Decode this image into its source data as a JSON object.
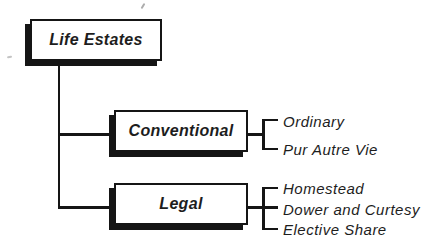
{
  "diagram": {
    "root_label": "Life Estates",
    "branches": [
      {
        "label": "Conventional",
        "children": [
          "Ordinary",
          "Pur Autre Vie"
        ]
      },
      {
        "label": "Legal",
        "children": [
          "Homestead",
          "Dower and Curtesy",
          "Elective Share"
        ]
      }
    ],
    "colors": {
      "line": "#151515",
      "text": "#1d1d1d",
      "background": "#ffffff",
      "box_fill": "#ffffff"
    }
  }
}
